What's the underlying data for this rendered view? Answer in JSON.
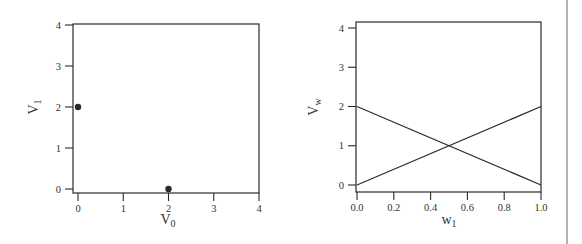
{
  "chart_data": [
    {
      "type": "scatter",
      "title": "",
      "xlabel": "V",
      "xlabel_sub": "0",
      "ylabel": "V",
      "ylabel_sub": "1",
      "xlim": [
        0,
        4
      ],
      "ylim": [
        0,
        4
      ],
      "xticks": [
        "0",
        "1",
        "2",
        "3",
        "4"
      ],
      "yticks": [
        "0",
        "1",
        "2",
        "3",
        "4"
      ],
      "grid": false,
      "points": [
        {
          "x": 0,
          "y": 2
        },
        {
          "x": 2,
          "y": 0
        }
      ]
    },
    {
      "type": "line",
      "title": "",
      "xlabel": "w",
      "xlabel_sub": "1",
      "ylabel": "V",
      "ylabel_sub": "w",
      "xlim": [
        0,
        1
      ],
      "ylim": [
        0,
        4
      ],
      "xticks": [
        "0.0",
        "0.2",
        "0.4",
        "0.6",
        "0.8",
        "1.0"
      ],
      "yticks": [
        "0",
        "1",
        "2",
        "3",
        "4"
      ],
      "grid": false,
      "series": [
        {
          "name": "decreasing",
          "x": [
            0,
            1
          ],
          "y": [
            2,
            0
          ]
        },
        {
          "name": "increasing",
          "x": [
            0,
            1
          ],
          "y": [
            0,
            2
          ]
        }
      ]
    }
  ]
}
